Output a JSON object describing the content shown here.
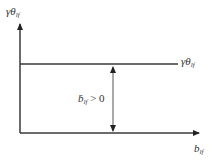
{
  "diagram": {
    "y_axis_label": {
      "base": "γθ",
      "sub": "lf"
    },
    "x_axis_label": {
      "base": "b",
      "sub": "lf"
    },
    "level_line_label": {
      "base": "γθ",
      "sub": "lf"
    },
    "gap_label": {
      "base": "ḃ",
      "sub": "lf",
      "suffix": " > 0"
    },
    "colors": {
      "line": "#3a3a3a",
      "text": "#333333",
      "background": "#ffffff"
    }
  }
}
